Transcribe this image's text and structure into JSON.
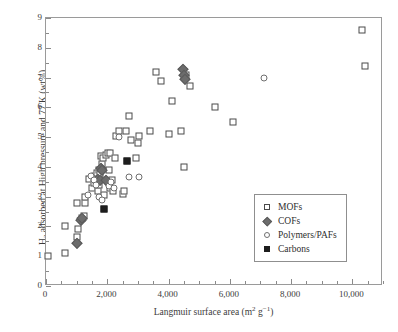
{
  "chart_data": {
    "type": "scatter",
    "title": "",
    "xlabel": "Langmuir surface area (m² g⁻¹)",
    "xlabel_parts": {
      "text": "Langmuir surface area (m",
      "sup1": "2",
      "mid": " g",
      "sup2": "−1",
      "close": ")"
    },
    "ylabel": "H₂ adsorbed at High pressure and 77 K (wt%)",
    "ylabel_parts": {
      "lead": "H",
      "sub": "2",
      "rest": " adsorbed at High pressure and 77 K (wt%)"
    },
    "xlim": [
      0,
      11000
    ],
    "ylim": [
      0,
      9
    ],
    "xticks": [
      0,
      2000,
      4000,
      6000,
      8000,
      10000
    ],
    "xticklabels": [
      "0",
      "2,000",
      "4,000",
      "6,000",
      "8,000",
      "10,000"
    ],
    "xminor_step": 500,
    "yticks": [
      0,
      1,
      2,
      3,
      4,
      5,
      6,
      7,
      8,
      9
    ],
    "yticklabels": [
      "0",
      "1",
      "2",
      "3",
      "4",
      "5",
      "6",
      "7",
      "8",
      "9"
    ],
    "yminor_step": 0.5,
    "grid": false,
    "legend_position": "lower-right-inside",
    "series": [
      {
        "name": "MOFs",
        "marker": "open-square",
        "color": "#4a4a4a",
        "points": [
          [
            80,
            1.0
          ],
          [
            620,
            1.1
          ],
          [
            620,
            2.0
          ],
          [
            1000,
            1.65
          ],
          [
            1060,
            1.9
          ],
          [
            1160,
            2.3
          ],
          [
            1240,
            2.35
          ],
          [
            1000,
            2.8
          ],
          [
            1260,
            2.8
          ],
          [
            1280,
            3.0
          ],
          [
            1400,
            3.6
          ],
          [
            1500,
            3.3
          ],
          [
            1560,
            3.45
          ],
          [
            1600,
            3.7
          ],
          [
            1640,
            3.55
          ],
          [
            1660,
            3.8
          ],
          [
            1700,
            3.2
          ],
          [
            1720,
            3.9
          ],
          [
            1740,
            3.4
          ],
          [
            1760,
            3.75
          ],
          [
            1800,
            4.35
          ],
          [
            1820,
            4.1
          ],
          [
            1860,
            4.3
          ],
          [
            1900,
            3.05
          ],
          [
            1960,
            4.4
          ],
          [
            2020,
            4.45
          ],
          [
            2060,
            3.9
          ],
          [
            2080,
            3.3
          ],
          [
            2100,
            4.45
          ],
          [
            2160,
            3.55
          ],
          [
            2200,
            3.2
          ],
          [
            2240,
            4.3
          ],
          [
            2300,
            5.05
          ],
          [
            2380,
            5.2
          ],
          [
            2500,
            3.1
          ],
          [
            2540,
            3.2
          ],
          [
            2600,
            5.2
          ],
          [
            2700,
            5.7
          ],
          [
            2760,
            4.9
          ],
          [
            2940,
            4.3
          ],
          [
            3000,
            4.8
          ],
          [
            3040,
            5.05
          ],
          [
            3400,
            5.2
          ],
          [
            3580,
            7.2
          ],
          [
            3740,
            6.9
          ],
          [
            4020,
            5.1
          ],
          [
            4120,
            6.2
          ],
          [
            4400,
            5.2
          ],
          [
            4500,
            4.0
          ],
          [
            4560,
            7.1
          ],
          [
            4700,
            6.7
          ],
          [
            5500,
            6.0
          ],
          [
            6100,
            5.5
          ],
          [
            10300,
            8.6
          ],
          [
            10400,
            7.4
          ]
        ]
      },
      {
        "name": "COFs",
        "marker": "filled-diamond",
        "color": "#6c6c6c",
        "points": [
          [
            1000,
            1.45
          ],
          [
            1140,
            2.2
          ],
          [
            1180,
            2.3
          ],
          [
            1700,
            3.6
          ],
          [
            1760,
            3.55
          ],
          [
            1800,
            3.95
          ],
          [
            1840,
            3.9
          ],
          [
            1960,
            3.55
          ],
          [
            4480,
            7.3
          ],
          [
            4520,
            7.1
          ],
          [
            4540,
            6.95
          ]
        ]
      },
      {
        "name": "Polymers/PAFs",
        "marker": "open-circle",
        "color": "#6f6f6f",
        "points": [
          [
            1360,
            3.05
          ],
          [
            1480,
            3.7
          ],
          [
            1560,
            3.55
          ],
          [
            1640,
            3.4
          ],
          [
            1720,
            3.0
          ],
          [
            1820,
            2.9
          ],
          [
            2060,
            3.35
          ],
          [
            2120,
            3.5
          ],
          [
            2220,
            3.3
          ],
          [
            2380,
            5.0
          ],
          [
            2700,
            3.65
          ],
          [
            3040,
            3.65
          ],
          [
            7100,
            7.0
          ]
        ]
      },
      {
        "name": "Carbons",
        "marker": "filled-square",
        "color": "#1d1d1d",
        "points": [
          [
            1880,
            2.6
          ],
          [
            2660,
            4.2
          ]
        ]
      }
    ]
  },
  "legend": {
    "items": [
      {
        "label": "MOFs",
        "marker": "open-square"
      },
      {
        "label": "COFs",
        "marker": "filled-diamond"
      },
      {
        "label": "Polymers/PAFs",
        "marker": "open-circle"
      },
      {
        "label": "Carbons",
        "marker": "filled-square"
      }
    ]
  }
}
